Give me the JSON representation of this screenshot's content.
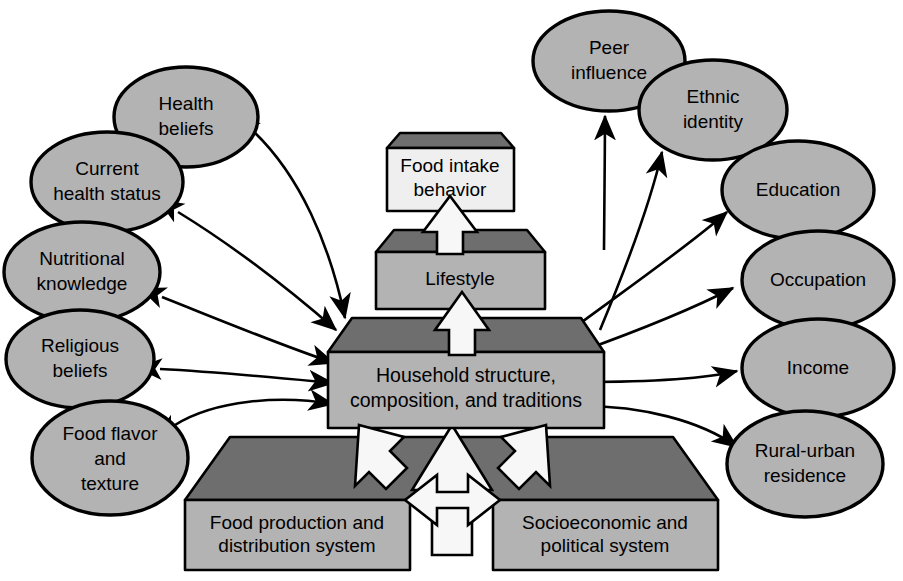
{
  "diagram": {
    "colors": {
      "ellipse_fill": "#b3b3b3",
      "box_front_fill": "#b3b3b3",
      "box_top_fill": "#6e6e6e",
      "box_light_front_fill": "#efefef",
      "outline": "#000000",
      "block_arrow_fill": "#f7f7f7",
      "background": "#ffffff"
    },
    "boxes": [
      {
        "id": "food-intake-behavior",
        "lines": [
          "Food intake",
          "behavior"
        ],
        "shade": "light"
      },
      {
        "id": "lifestyle",
        "lines": [
          "Lifestyle"
        ],
        "shade": "medium"
      },
      {
        "id": "household-structure",
        "lines": [
          "Household structure,",
          "composition, and traditions"
        ],
        "shade": "medium"
      },
      {
        "id": "food-production",
        "lines": [
          "Food production and",
          "distribution system"
        ],
        "shade": "medium"
      },
      {
        "id": "socioeconomic-system",
        "lines": [
          "Socioeconomic and",
          "political system"
        ],
        "shade": "medium"
      }
    ],
    "ellipses_left": [
      {
        "id": "health-beliefs",
        "lines": [
          "Health",
          "beliefs"
        ]
      },
      {
        "id": "current-health-status",
        "lines": [
          "Current",
          "health status"
        ]
      },
      {
        "id": "nutritional-knowledge",
        "lines": [
          "Nutritional",
          "knowledge"
        ]
      },
      {
        "id": "religious-beliefs",
        "lines": [
          "Religious",
          "beliefs"
        ]
      },
      {
        "id": "food-flavor-texture",
        "lines": [
          "Food flavor",
          "and",
          "texture"
        ]
      }
    ],
    "ellipses_right": [
      {
        "id": "peer-influence",
        "lines": [
          "Peer",
          "influence"
        ]
      },
      {
        "id": "ethnic-identity",
        "lines": [
          "Ethnic",
          "identity"
        ]
      },
      {
        "id": "education",
        "lines": [
          "Education"
        ]
      },
      {
        "id": "occupation",
        "lines": [
          "Occupation"
        ]
      },
      {
        "id": "income",
        "lines": [
          "Income"
        ]
      },
      {
        "id": "rural-urban-residence",
        "lines": [
          "Rural-urban",
          "residence"
        ]
      }
    ],
    "connectors": {
      "bidirectional_left_count": 5,
      "bidirectional_right_count": 4,
      "into_peer_influence": 1,
      "into_ethnic_identity": 1,
      "block_arrows": [
        "lifestyle-to-food-intake",
        "household-to-lifestyle",
        "food-production-to-household",
        "socioeconomic-to-household",
        "systems-up-to-household",
        "food-production-socioeconomic-bidirectional"
      ]
    }
  }
}
